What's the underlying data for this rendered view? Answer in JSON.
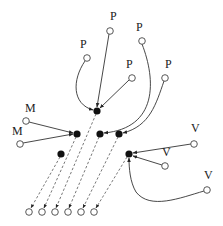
{
  "labels": {
    "p1": "P",
    "p2": "P",
    "p3": "P",
    "p4": "P",
    "p5": "P",
    "m1": "M",
    "m2": "M",
    "v1": "V",
    "v2": "V",
    "v3": "V"
  },
  "nodes": {
    "p1": {
      "type": "open",
      "x": 87,
      "y": 58
    },
    "p2": {
      "type": "open",
      "x": 110,
      "y": 31
    },
    "p3": {
      "type": "open",
      "x": 142,
      "y": 41
    },
    "p4": {
      "type": "open",
      "x": 132,
      "y": 78
    },
    "p5": {
      "type": "open",
      "x": 165,
      "y": 78
    },
    "m1": {
      "type": "open",
      "x": 26,
      "y": 121
    },
    "m2": {
      "type": "open",
      "x": 20,
      "y": 144
    },
    "v1": {
      "type": "open",
      "x": 194,
      "y": 144
    },
    "v2": {
      "type": "open",
      "x": 165,
      "y": 166
    },
    "v3": {
      "type": "open",
      "x": 207,
      "y": 190
    },
    "hubA": {
      "type": "filled",
      "x": 97,
      "y": 111
    },
    "hubB": {
      "type": "filled",
      "x": 77,
      "y": 134
    },
    "hubC": {
      "type": "filled",
      "x": 100,
      "y": 134
    },
    "hubD": {
      "type": "filled",
      "x": 119,
      "y": 134
    },
    "hubE": {
      "type": "filled",
      "x": 129,
      "y": 154
    },
    "hubF": {
      "type": "filled",
      "x": 61,
      "y": 154
    },
    "out1": {
      "type": "open",
      "x": 29,
      "y": 212
    },
    "out2": {
      "type": "open",
      "x": 42,
      "y": 212
    },
    "out3": {
      "type": "open",
      "x": 55,
      "y": 212
    },
    "out4": {
      "type": "open",
      "x": 68,
      "y": 212
    },
    "out5": {
      "type": "open",
      "x": 81,
      "y": 212
    },
    "out6": {
      "type": "open",
      "x": 94,
      "y": 212
    }
  },
  "edges": [
    {
      "from": "p1",
      "to": "hubA",
      "style": "solid",
      "shape": "curve"
    },
    {
      "from": "p2",
      "to": "hubA",
      "style": "solid",
      "shape": "straight"
    },
    {
      "from": "p4",
      "to": "hubA",
      "style": "solid",
      "shape": "straight"
    },
    {
      "from": "p3",
      "to": "hubC",
      "style": "solid",
      "shape": "curve"
    },
    {
      "from": "p5",
      "to": "hubD",
      "style": "solid",
      "shape": "curve"
    },
    {
      "from": "m1",
      "to": "hubB",
      "style": "solid",
      "shape": "straight"
    },
    {
      "from": "m2",
      "to": "hubB",
      "style": "solid",
      "shape": "straight"
    },
    {
      "from": "v1",
      "to": "hubE",
      "style": "solid",
      "shape": "straight"
    },
    {
      "from": "v2",
      "to": "hubE",
      "style": "solid",
      "shape": "straight"
    },
    {
      "from": "v3",
      "to": "hubE",
      "style": "solid",
      "shape": "curve"
    },
    {
      "from": "hubF",
      "to": "out1",
      "style": "dashed"
    },
    {
      "from": "hubB",
      "to": "out2",
      "style": "dashed"
    },
    {
      "from": "hubA",
      "to": "out3",
      "style": "dashed"
    },
    {
      "from": "hubC",
      "to": "out4",
      "style": "dashed"
    },
    {
      "from": "hubD",
      "to": "out5",
      "style": "dashed"
    },
    {
      "from": "hubE",
      "to": "out6",
      "style": "dashed"
    }
  ],
  "colors": {
    "stroke": "#333333",
    "dashed": "#555555",
    "filled": "#111111",
    "open_stroke": "#444444",
    "background": "#ffffff"
  }
}
